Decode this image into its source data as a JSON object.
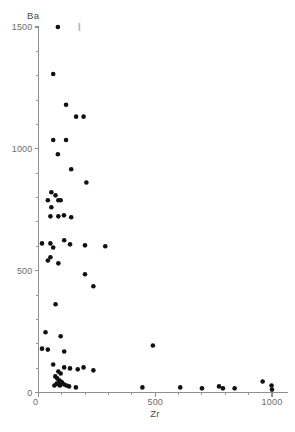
{
  "chart_data": {
    "type": "scatter",
    "title": "",
    "xlabel": "Zr",
    "ylabel": "Ba",
    "xlim": [
      0,
      1070
    ],
    "ylim": [
      0,
      1540
    ],
    "grid": false,
    "legend": null,
    "x_ticks_major": [
      0,
      500,
      1000
    ],
    "x_ticklabels": [
      "0",
      "500",
      "1000"
    ],
    "x_ticks_minor": [
      100,
      200,
      300,
      400,
      600,
      700,
      800,
      900
    ],
    "y_ticks_major": [
      0,
      500,
      1000,
      1500
    ],
    "y_ticklabels": [
      "0",
      "500",
      "1000",
      "1500"
    ],
    "y_ticks_minor": [
      100,
      200,
      300,
      400,
      600,
      700,
      800,
      900,
      1100,
      1200,
      1300,
      1400
    ],
    "marker": "filled-circle",
    "marker_color": "#111111",
    "points": [
      [
        83,
        1500
      ],
      [
        63,
        1307
      ],
      [
        118,
        1181
      ],
      [
        161,
        1132
      ],
      [
        193,
        1132
      ],
      [
        63,
        1036
      ],
      [
        118,
        1036
      ],
      [
        83,
        978
      ],
      [
        140,
        916
      ],
      [
        205,
        862
      ],
      [
        55,
        822
      ],
      [
        73,
        809
      ],
      [
        40,
        789
      ],
      [
        85,
        789
      ],
      [
        95,
        789
      ],
      [
        55,
        760
      ],
      [
        51,
        723
      ],
      [
        85,
        723
      ],
      [
        109,
        727
      ],
      [
        140,
        719
      ],
      [
        15,
        612
      ],
      [
        110,
        625
      ],
      [
        51,
        612
      ],
      [
        63,
        595
      ],
      [
        135,
        608
      ],
      [
        199,
        604
      ],
      [
        286,
        600
      ],
      [
        51,
        555
      ],
      [
        40,
        542
      ],
      [
        85,
        530
      ],
      [
        199,
        485
      ],
      [
        235,
        436
      ],
      [
        73,
        362
      ],
      [
        490,
        193
      ],
      [
        30,
        247
      ],
      [
        95,
        231
      ],
      [
        15,
        180
      ],
      [
        40,
        176
      ],
      [
        110,
        168
      ],
      [
        63,
        115
      ],
      [
        110,
        103
      ],
      [
        135,
        99
      ],
      [
        168,
        95
      ],
      [
        193,
        103
      ],
      [
        235,
        91
      ],
      [
        85,
        86
      ],
      [
        95,
        78
      ],
      [
        72,
        66
      ],
      [
        80,
        58
      ],
      [
        88,
        50
      ],
      [
        95,
        45
      ],
      [
        101,
        41
      ],
      [
        78,
        37
      ],
      [
        86,
        33
      ],
      [
        92,
        29
      ],
      [
        68,
        29
      ],
      [
        110,
        33
      ],
      [
        120,
        29
      ],
      [
        131,
        25
      ],
      [
        160,
        21
      ],
      [
        445,
        21
      ],
      [
        607,
        21
      ],
      [
        700,
        17
      ],
      [
        773,
        25
      ],
      [
        790,
        17
      ],
      [
        840,
        17
      ],
      [
        960,
        45
      ],
      [
        998,
        29
      ],
      [
        1000,
        12
      ]
    ],
    "offscale_markers": [
      {
        "x": 175,
        "y": 1500,
        "note": "faint tick above axis top"
      }
    ]
  },
  "axis_labels": {
    "y_title": "Ba",
    "x_title": "Zr"
  }
}
